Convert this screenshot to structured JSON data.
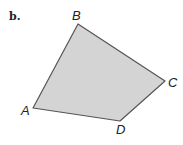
{
  "figure": {
    "part_label": "b.",
    "shape": "quadrilateral",
    "fill_color": "#d4d4d4",
    "stroke_color": "#555555",
    "vertices": [
      {
        "name": "A",
        "x": 33,
        "y": 108,
        "label_x": 21,
        "label_y": 115
      },
      {
        "name": "B",
        "x": 78,
        "y": 24,
        "label_x": 72,
        "label_y": 20
      },
      {
        "name": "C",
        "x": 165,
        "y": 81,
        "label_x": 168,
        "label_y": 87
      },
      {
        "name": "D",
        "x": 120,
        "y": 121,
        "label_x": 116,
        "label_y": 134
      }
    ],
    "labels": {
      "a": "A",
      "b": "B",
      "c": "C",
      "d": "D"
    }
  }
}
